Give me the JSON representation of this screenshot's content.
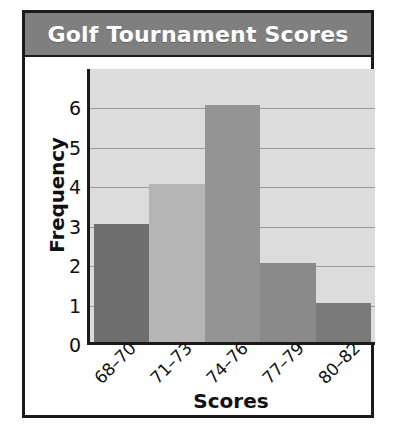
{
  "figure": {
    "title": "Golf Tournament Scores",
    "frame_border_color": "#1a1a1a",
    "title_bar_color": "#7f7f7f",
    "title_text_color": "#ffffff",
    "page_background": "#ffffff"
  },
  "chart_data": {
    "type": "bar",
    "title": "Golf Tournament Scores",
    "categories": [
      "68–70",
      "71–73",
      "74–76",
      "77–79",
      "80–82"
    ],
    "values": [
      3,
      4,
      6,
      2,
      1
    ],
    "xlabel": "Scores",
    "ylabel": "Frequency",
    "ylim": [
      0,
      7
    ],
    "yticks": [
      0,
      1,
      2,
      3,
      4,
      5,
      6
    ],
    "ytick_labels": [
      "0",
      "1",
      "2",
      "3",
      "4",
      "5",
      "6"
    ],
    "grid": "horizontal",
    "legend": "none",
    "bar_gap": "none",
    "plot_background": "#dcdcdc",
    "gridline_color": "#9a9a9a",
    "bar_colors": [
      "#6e6e6e",
      "#b5b5b5",
      "#949494",
      "#8a8a8a",
      "#7a7a7a"
    ],
    "xtick_rotation": -45
  }
}
